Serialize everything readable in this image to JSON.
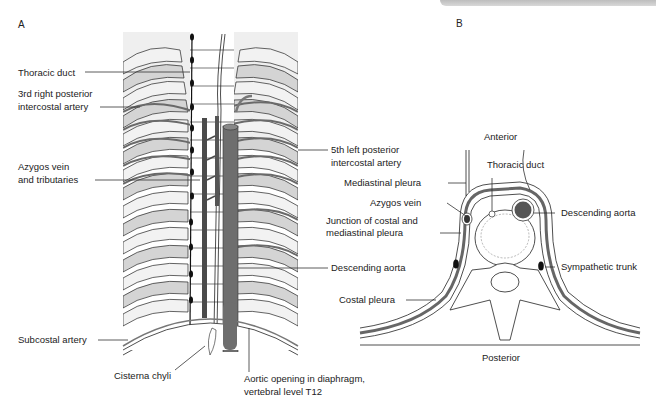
{
  "panels": {
    "a": {
      "letter": "A",
      "labels": {
        "thoracic_duct": "Thoracic duct",
        "third_right_posterior_intercostal_artery_l1": "3rd right posterior",
        "third_right_posterior_intercostal_artery_l2": "intercostal artery",
        "azygos_vein_l1": "Azygos vein",
        "azygos_vein_l2": "and tributaries",
        "subcostal_artery": "Subcostal artery",
        "cisterna_chyli": "Cisterna chyli",
        "aortic_opening_l1": "Aortic opening in diaphragm,",
        "aortic_opening_l2": "vertebral level T12",
        "fifth_left_posterior_intercostal_artery_l1": "5th left posterior",
        "fifth_left_posterior_intercostal_artery_l2": "intercostal artery",
        "descending_aorta": "Descending aorta"
      }
    },
    "b": {
      "letter": "B",
      "labels": {
        "anterior": "Anterior",
        "thoracic_duct": "Thoracic duct",
        "mediastinal_pleura": "Mediastinal pleura",
        "azygos_vein": "Azygos vein",
        "junction_l1": "Junction of costal and",
        "junction_l2": "mediastinal pleura",
        "descending_aorta": "Descending aorta",
        "sympathetic_trunk": "Sympathetic trunk",
        "costal_pleura": "Costal pleura",
        "posterior": "Posterior"
      }
    }
  },
  "colors": {
    "rib_fill": "#d3d3d3",
    "rib_light": "#ececec",
    "aorta": "#6e6e6e",
    "vein": "#4a4a4a",
    "outline": "#222222",
    "banner": "#c8c8c8"
  }
}
